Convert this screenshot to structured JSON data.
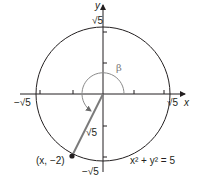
{
  "diagram": {
    "type": "unit-circle-style coordinate diagram",
    "axes": {
      "x_label": "x",
      "y_label": "y"
    },
    "circle": {
      "equation": "x² + y² = 5",
      "radius_label": "√5"
    },
    "tick_labels": {
      "top": "√5",
      "bottom": "−√5",
      "left": "−√5",
      "right": "√5"
    },
    "angle_label": "β",
    "segment_label": "√5",
    "point_label": "(x, −2)",
    "colors": {
      "ink": "#231f20",
      "terminal_side": "#7a7a7a",
      "angle_arc": "#8a8a8a"
    }
  }
}
